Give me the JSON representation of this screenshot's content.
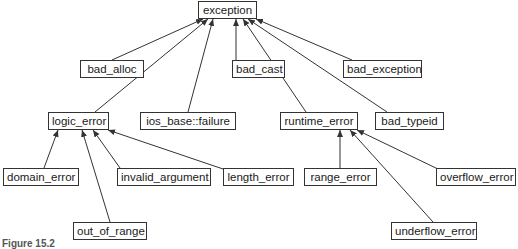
{
  "diagram": {
    "colors": {
      "stroke": "#333333",
      "text": "#1a1a1a",
      "background": "#ffffff"
    },
    "nodes": {
      "exception": {
        "label": "exception",
        "x": 198,
        "y": 1,
        "w": 59,
        "h": 18
      },
      "bad_alloc": {
        "label": "bad_alloc",
        "x": 80,
        "y": 60,
        "w": 64,
        "h": 18
      },
      "bad_cast": {
        "label": "bad_cast",
        "x": 232,
        "y": 60,
        "w": 53,
        "h": 18
      },
      "bad_exception": {
        "label": "bad_exception",
        "x": 343,
        "y": 60,
        "w": 79,
        "h": 18
      },
      "logic_error": {
        "label": "logic_error",
        "x": 48,
        "y": 112,
        "w": 61,
        "h": 18
      },
      "ios_base_failure": {
        "label": "ios_base::failure",
        "x": 140,
        "y": 112,
        "w": 96,
        "h": 18
      },
      "runtime_error": {
        "label": "runtime_error",
        "x": 280,
        "y": 112,
        "w": 78,
        "h": 18
      },
      "bad_typeid": {
        "label": "bad_typeid",
        "x": 375,
        "y": 112,
        "w": 69,
        "h": 18
      },
      "domain_error": {
        "label": "domain_error",
        "x": 3,
        "y": 168,
        "w": 76,
        "h": 18
      },
      "invalid_argument": {
        "label": "invalid_argument",
        "x": 117,
        "y": 168,
        "w": 94,
        "h": 18
      },
      "length_error": {
        "label": "length_error",
        "x": 223,
        "y": 168,
        "w": 71,
        "h": 18
      },
      "range_error": {
        "label": "range_error",
        "x": 304,
        "y": 168,
        "w": 73,
        "h": 18
      },
      "overflow_error": {
        "label": "overflow_error",
        "x": 436,
        "y": 168,
        "w": 80,
        "h": 18
      },
      "out_of_range": {
        "label": "out_of_range",
        "x": 73,
        "y": 222,
        "w": 74,
        "h": 18
      },
      "underflow_error": {
        "label": "underflow_error",
        "x": 391,
        "y": 222,
        "w": 86,
        "h": 18
      }
    },
    "edges": [
      {
        "from": "bad_alloc",
        "to": "exception",
        "x1": 112,
        "y1": 60,
        "x2": 203,
        "y2": 19
      },
      {
        "from": "logic_error",
        "to": "exception",
        "x1": 95,
        "y1": 112,
        "x2": 208,
        "y2": 19
      },
      {
        "from": "ios_base_failure",
        "to": "exception",
        "x1": 188,
        "y1": 112,
        "x2": 213,
        "y2": 19
      },
      {
        "from": "bad_cast",
        "to": "exception",
        "x1": 236,
        "y1": 60,
        "x2": 236,
        "y2": 19
      },
      {
        "from": "runtime_error",
        "to": "exception",
        "x1": 306,
        "y1": 112,
        "x2": 243,
        "y2": 19
      },
      {
        "from": "bad_typeid",
        "to": "exception",
        "x1": 387,
        "y1": 112,
        "x2": 248,
        "y2": 19
      },
      {
        "from": "bad_exception",
        "to": "exception",
        "x1": 352,
        "y1": 60,
        "x2": 256,
        "y2": 19
      },
      {
        "from": "domain_error",
        "to": "logic_error",
        "x1": 44,
        "y1": 168,
        "x2": 58,
        "y2": 130
      },
      {
        "from": "out_of_range",
        "to": "logic_error",
        "x1": 110,
        "y1": 222,
        "x2": 82,
        "y2": 130
      },
      {
        "from": "invalid_argument",
        "to": "logic_error",
        "x1": 120,
        "y1": 168,
        "x2": 93,
        "y2": 130
      },
      {
        "from": "length_error",
        "to": "logic_error",
        "x1": 226,
        "y1": 170,
        "x2": 108,
        "y2": 130
      },
      {
        "from": "range_error",
        "to": "runtime_error",
        "x1": 340,
        "y1": 168,
        "x2": 340,
        "y2": 130
      },
      {
        "from": "underflow_error",
        "to": "runtime_error",
        "x1": 433,
        "y1": 222,
        "x2": 350,
        "y2": 130
      },
      {
        "from": "overflow_error",
        "to": "runtime_error",
        "x1": 440,
        "y1": 170,
        "x2": 357,
        "y2": 130
      }
    ],
    "caption": "Figure 15.2"
  }
}
